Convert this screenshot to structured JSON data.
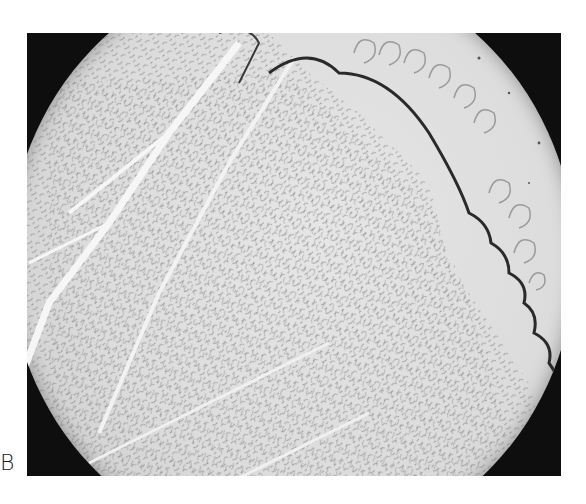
{
  "figure": {
    "panel_label": "B",
    "colors": {
      "background": "#ffffff",
      "vignette": "#0e0e0e",
      "field": "#dcdcdc",
      "texture_dark": "#5a5a5a",
      "channel_light": "#f4f4f4"
    }
  }
}
